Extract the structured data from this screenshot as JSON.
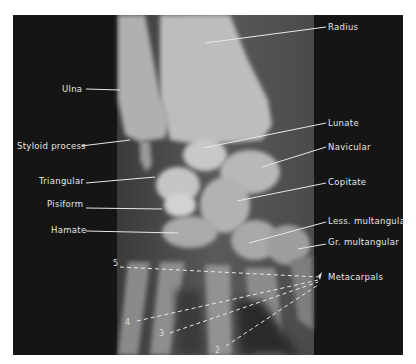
{
  "figure": {
    "colors": {
      "background": "#141414",
      "panel": "#6e6e6e",
      "bone": "#cfcfcf",
      "label": "#e6e6e6",
      "page": "#ffffff"
    }
  },
  "labels": [
    {
      "id": "radius",
      "text": "Radius",
      "x": 328,
      "y": 22,
      "line": [
        326,
        27,
        205,
        43
      ]
    },
    {
      "id": "ulna",
      "text": "Ulna",
      "x": 62,
      "y": 84,
      "line": [
        86,
        89,
        120,
        90
      ]
    },
    {
      "id": "styloid-process",
      "text": "Styloid process",
      "x": 17,
      "y": 141,
      "line": [
        81,
        146,
        130,
        140
      ]
    },
    {
      "id": "lunate",
      "text": "Lunate",
      "x": 328,
      "y": 118,
      "line": [
        326,
        123,
        203,
        148
      ]
    },
    {
      "id": "navicular",
      "text": "Navicular",
      "x": 328,
      "y": 142,
      "line": [
        326,
        147,
        262,
        167
      ]
    },
    {
      "id": "triangular",
      "text": "Triangular",
      "x": 39,
      "y": 176,
      "line": [
        86,
        183,
        155,
        177
      ]
    },
    {
      "id": "copitate",
      "text": "Copitate",
      "x": 328,
      "y": 177,
      "line": [
        326,
        183,
        237,
        201
      ]
    },
    {
      "id": "pisiform",
      "text": "Pisiform",
      "x": 47,
      "y": 199,
      "line": [
        86,
        208,
        162,
        209
      ]
    },
    {
      "id": "hamate",
      "text": "Hamate",
      "x": 51,
      "y": 225,
      "line": [
        86,
        231,
        178,
        233
      ]
    },
    {
      "id": "less-multangular",
      "text": "Less. multangular",
      "x": 328,
      "y": 216,
      "line": [
        326,
        222,
        249,
        243
      ]
    },
    {
      "id": "gr-multangular",
      "text": "Gr. multangular",
      "x": 328,
      "y": 237,
      "line": [
        326,
        244,
        298,
        249
      ]
    },
    {
      "id": "metacarpals",
      "text": "Metacarpals",
      "x": 328,
      "y": 272,
      "line": null
    }
  ],
  "metacarpal_numbers": [
    {
      "text": "5",
      "x": 113,
      "y": 259,
      "line": [
        120,
        267,
        318,
        277
      ]
    },
    {
      "text": "4",
      "x": 125,
      "y": 318,
      "line": [
        137,
        321,
        318,
        280
      ]
    },
    {
      "text": "3",
      "x": 159,
      "y": 329,
      "line": [
        170,
        333,
        318,
        282
      ]
    },
    {
      "text": "2",
      "x": 215,
      "y": 346,
      "line": [
        226,
        346,
        318,
        285
      ]
    }
  ]
}
